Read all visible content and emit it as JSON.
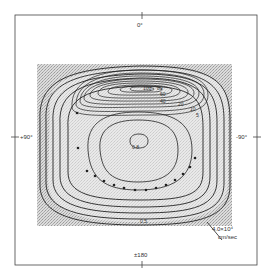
{
  "figure": {
    "axis_labels": {
      "top": "0°",
      "left": "+90°",
      "right": "-90°",
      "bottom": "±180"
    },
    "scale": {
      "value": "4.0×10⁴",
      "unit": "cm/sec"
    },
    "contour_labels": {
      "upper_cell": [
        "100",
        "80",
        "60",
        "40",
        "20",
        "10",
        "5"
      ],
      "lower_cell": [
        "0.5",
        "1",
        "2",
        "5",
        "10",
        "20",
        "0.5"
      ],
      "center": "0.8"
    },
    "colors": {
      "line": "#222222",
      "stipple": "#b8b8b8",
      "frame": "#444444"
    }
  }
}
